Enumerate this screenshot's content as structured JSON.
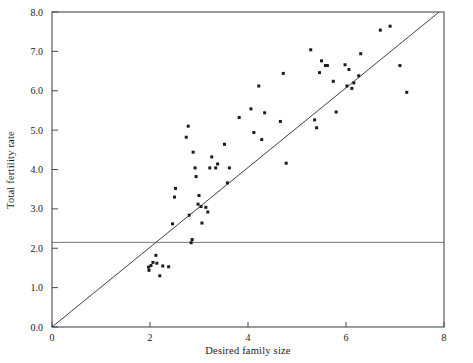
{
  "chart_data": {
    "type": "scatter",
    "title": "",
    "xlabel": "Desired family size",
    "ylabel": "Total fertility rate",
    "xlim": [
      0,
      8
    ],
    "ylim": [
      0,
      8
    ],
    "xticks": [
      0,
      2,
      4,
      6,
      8
    ],
    "xtick_labels": [
      "0",
      "2",
      "4",
      "6",
      "8"
    ],
    "yticks": [
      0.0,
      1.0,
      2.0,
      3.0,
      4.0,
      5.0,
      6.0,
      7.0,
      8.0
    ],
    "ytick_labels": [
      "0.0",
      "1.0",
      "2.0",
      "3.0",
      "4.0",
      "5.0",
      "6.0",
      "7.0",
      "8.0"
    ],
    "grid": false,
    "legend": null,
    "marker": "square",
    "marker_color": "#1b1b1b",
    "marker_size": 3,
    "reference_lines": [
      {
        "name": "replacement-fertility-line",
        "orientation": "horizontal",
        "y": 2.15,
        "color": "#666666"
      },
      {
        "name": "equality-line",
        "orientation": "diagonal",
        "x0": 0.0,
        "y0": 0.0,
        "x1": 7.9,
        "y1": 8.0,
        "color": "#2a2a2a"
      }
    ],
    "points": [
      [
        1.97,
        1.52
      ],
      [
        1.98,
        1.44
      ],
      [
        2.02,
        1.56
      ],
      [
        2.06,
        1.64
      ],
      [
        2.12,
        1.82
      ],
      [
        2.14,
        1.62
      ],
      [
        2.2,
        1.3
      ],
      [
        2.26,
        1.55
      ],
      [
        2.38,
        1.53
      ],
      [
        2.46,
        2.62
      ],
      [
        2.5,
        3.3
      ],
      [
        2.52,
        3.52
      ],
      [
        2.74,
        4.82
      ],
      [
        2.78,
        5.1
      ],
      [
        2.8,
        2.84
      ],
      [
        2.84,
        2.14
      ],
      [
        2.86,
        2.22
      ],
      [
        2.88,
        4.44
      ],
      [
        2.92,
        4.04
      ],
      [
        2.94,
        3.82
      ],
      [
        2.98,
        3.12
      ],
      [
        3.0,
        3.34
      ],
      [
        3.04,
        3.06
      ],
      [
        3.06,
        2.64
      ],
      [
        3.14,
        3.04
      ],
      [
        3.18,
        2.92
      ],
      [
        3.22,
        4.04
      ],
      [
        3.26,
        4.32
      ],
      [
        3.34,
        4.04
      ],
      [
        3.38,
        4.14
      ],
      [
        3.52,
        4.64
      ],
      [
        3.58,
        3.66
      ],
      [
        3.62,
        4.04
      ],
      [
        3.82,
        5.32
      ],
      [
        4.06,
        5.54
      ],
      [
        4.12,
        4.94
      ],
      [
        4.22,
        6.12
      ],
      [
        4.28,
        4.76
      ],
      [
        4.34,
        5.44
      ],
      [
        4.66,
        5.22
      ],
      [
        4.72,
        6.44
      ],
      [
        4.78,
        4.16
      ],
      [
        5.28,
        7.04
      ],
      [
        5.36,
        5.26
      ],
      [
        5.4,
        5.06
      ],
      [
        5.46,
        6.46
      ],
      [
        5.5,
        6.76
      ],
      [
        5.58,
        6.64
      ],
      [
        5.62,
        6.64
      ],
      [
        5.74,
        6.24
      ],
      [
        5.8,
        5.46
      ],
      [
        5.98,
        6.66
      ],
      [
        6.02,
        6.12
      ],
      [
        6.06,
        6.54
      ],
      [
        6.12,
        6.06
      ],
      [
        6.16,
        6.2
      ],
      [
        6.26,
        6.38
      ],
      [
        6.3,
        6.94
      ],
      [
        6.7,
        7.54
      ],
      [
        6.9,
        7.64
      ],
      [
        7.1,
        6.64
      ],
      [
        7.24,
        5.96
      ]
    ]
  }
}
